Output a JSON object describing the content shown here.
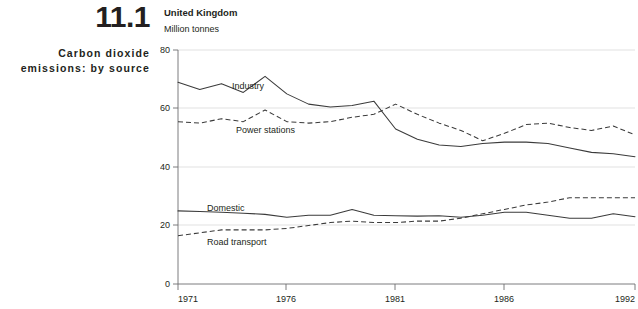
{
  "figure": {
    "number": "11.1",
    "title": "Carbon dioxide emissions: by source"
  },
  "chart": {
    "heading": "United Kingdom",
    "units": "Million tonnes"
  },
  "labels": {
    "industry": "Industry",
    "power_stations": "Power stations",
    "domestic": "Domestic",
    "road_transport": "Road transport"
  },
  "axis": {
    "y_ticks": [
      "0",
      "20",
      "40",
      "60",
      "80"
    ],
    "x_ticks": [
      "1971",
      "1976",
      "1981",
      "1986",
      "1992"
    ]
  },
  "chart_data": {
    "type": "line",
    "title": "Carbon dioxide emissions: by source",
    "subtitle": "United Kingdom",
    "xlabel": "",
    "ylabel": "Million tonnes",
    "ylim": [
      0,
      80
    ],
    "xlim": [
      1971,
      1992
    ],
    "grid": true,
    "legend": "inline-labels",
    "x": [
      1971,
      1972,
      1973,
      1974,
      1975,
      1976,
      1977,
      1978,
      1979,
      1980,
      1981,
      1982,
      1983,
      1984,
      1985,
      1986,
      1987,
      1988,
      1989,
      1990,
      1991,
      1992
    ],
    "series": [
      {
        "name": "Industry",
        "style": "solid",
        "values": [
          69.0,
          66.5,
          68.5,
          65.5,
          71.0,
          65.0,
          61.5,
          60.5,
          61.0,
          62.5,
          53.0,
          49.5,
          47.5,
          47.0,
          48.0,
          48.5,
          48.5,
          48.0,
          46.5,
          45.0,
          44.5,
          43.5
        ]
      },
      {
        "name": "Power stations",
        "style": "dashed",
        "values": [
          55.5,
          55.0,
          56.5,
          55.5,
          59.5,
          55.5,
          55.0,
          55.5,
          57.0,
          58.0,
          61.5,
          58.0,
          55.0,
          52.5,
          49.0,
          51.5,
          54.5,
          55.0,
          53.5,
          52.5,
          54.0,
          51.0
        ]
      },
      {
        "name": "Domestic",
        "style": "solid",
        "values": [
          25.0,
          24.8,
          24.5,
          24.2,
          23.8,
          22.8,
          23.5,
          23.5,
          25.5,
          23.5,
          23.3,
          23.2,
          23.3,
          22.8,
          23.5,
          24.5,
          24.5,
          23.5,
          22.5,
          22.5,
          24.0,
          23.0
        ]
      },
      {
        "name": "Road transport",
        "style": "dashed",
        "values": [
          16.5,
          17.5,
          18.5,
          18.5,
          18.5,
          19.0,
          20.0,
          21.0,
          21.5,
          21.0,
          21.0,
          21.5,
          21.5,
          22.5,
          24.0,
          25.5,
          27.0,
          28.0,
          29.5,
          29.5,
          29.5,
          29.5
        ]
      }
    ]
  }
}
